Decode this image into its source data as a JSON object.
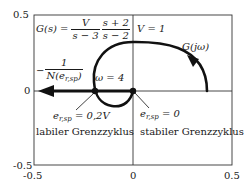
{
  "diagram": {
    "type": "nyquist-plot",
    "axes": {
      "x_ticks": [
        "-0.5",
        "0",
        "0.5"
      ],
      "y_ticks": [
        "0.5",
        "0",
        "-0.5"
      ],
      "xlim": [
        -0.5,
        0.5
      ],
      "ylim": [
        -0.5,
        0.5
      ]
    },
    "transfer_function": {
      "lhs": "G(s) =",
      "frac1_num": "V",
      "frac1_den": "s − 3",
      "frac2_num": "s + 2",
      "frac2_den": "s − 2"
    },
    "gain_label": "V = 1",
    "curve_label": "G(jω)",
    "describing_function": {
      "prefix": "−",
      "num": "1",
      "den_main": "N(e",
      "den_sub": "r,sp",
      "den_close": ")"
    },
    "omega_label": "ω = 4",
    "unstable_point": {
      "var": "e",
      "sub": "r,sp",
      "value": " = 0,2V",
      "caption": "labiler Grenzzyklus"
    },
    "stable_point": {
      "var": "e",
      "sub": "r,sp",
      "value": " = 0",
      "caption": "stabiler Grenzzyklus"
    },
    "colors": {
      "line": "#111111",
      "frame": "#333333",
      "background": "#ffffff"
    }
  }
}
